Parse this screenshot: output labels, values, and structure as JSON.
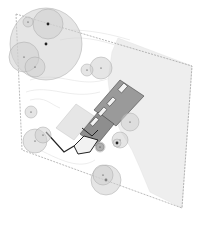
{
  "diagram": {
    "type": "site-plan",
    "colors": {
      "background": "#ffffff",
      "lawn": "#eeeeee",
      "tree_fill": "#cfcfcf",
      "tree_stroke": "#a8a8a8",
      "trunk": "#222222",
      "boundary": "#8a8a8a",
      "building_fill": "#9a9a9a",
      "building_dark": "#3a3a3a",
      "wall": "#222222",
      "contour": "#d8d8d8"
    },
    "boundary": {
      "points": [
        [
          16,
          14
        ],
        [
          192,
          66
        ],
        [
          182,
          208
        ],
        [
          22,
          150
        ]
      ]
    },
    "lawn": {
      "points": [
        [
          118,
          38
        ],
        [
          192,
          66
        ],
        [
          182,
          208
        ],
        [
          150,
          192
        ],
        [
          140,
          168
        ],
        [
          132,
          150
        ],
        [
          120,
          130
        ],
        [
          112,
          110
        ],
        [
          108,
          80
        ],
        [
          112,
          52
        ]
      ]
    },
    "trees": [
      {
        "cx": 46,
        "cy": 44,
        "r": 36,
        "trunk": true
      },
      {
        "cx": 48,
        "cy": 24,
        "r": 15,
        "trunk": true
      },
      {
        "cx": 24,
        "cy": 57,
        "r": 15,
        "trunk": false
      },
      {
        "cx": 35,
        "cy": 67,
        "r": 10,
        "trunk": false
      },
      {
        "cx": 101,
        "cy": 68,
        "r": 11,
        "trunk": false
      },
      {
        "cx": 87,
        "cy": 70,
        "r": 6,
        "trunk": false
      },
      {
        "cx": 35,
        "cy": 141,
        "r": 12,
        "trunk": false
      },
      {
        "cx": 43,
        "cy": 135,
        "r": 8,
        "trunk": false
      },
      {
        "cx": 31,
        "cy": 112,
        "r": 6,
        "trunk": false
      },
      {
        "cx": 130,
        "cy": 122,
        "r": 9,
        "trunk": false
      },
      {
        "cx": 120,
        "cy": 140,
        "r": 8,
        "trunk": false
      },
      {
        "cx": 117,
        "cy": 143,
        "r": 4,
        "trunk": true
      },
      {
        "cx": 106,
        "cy": 180,
        "r": 15,
        "trunk": true
      },
      {
        "cx": 103,
        "cy": 175,
        "r": 10,
        "trunk": false
      },
      {
        "cx": 100,
        "cy": 147,
        "r": 5,
        "trunk": false
      },
      {
        "cx": 28,
        "cy": 22,
        "r": 5,
        "trunk": false
      }
    ],
    "building": {
      "main_wing": [
        [
          96,
          108
        ],
        [
          122,
          80
        ],
        [
          142,
          94
        ],
        [
          116,
          124
        ]
      ],
      "connector": [
        [
          78,
          130
        ],
        [
          96,
          108
        ],
        [
          112,
          122
        ],
        [
          96,
          142
        ]
      ],
      "south_wing": [
        [
          46,
          136
        ],
        [
          66,
          110
        ],
        [
          86,
          122
        ],
        [
          66,
          150
        ]
      ],
      "terrace": [
        [
          62,
          122
        ],
        [
          80,
          102
        ],
        [
          94,
          112
        ],
        [
          76,
          132
        ]
      ]
    },
    "labels": []
  }
}
